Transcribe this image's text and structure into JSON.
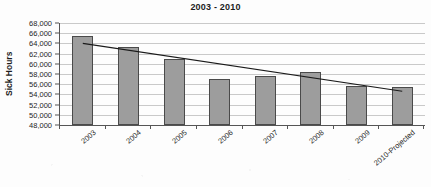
{
  "chart_data": {
    "type": "bar",
    "title": "2003 - 2010",
    "xlabel": "",
    "ylabel": "Sick Hours",
    "categories": [
      "2003",
      "2004",
      "2005",
      "2006",
      "2007",
      "2008",
      "2009",
      "2010-Projected"
    ],
    "values": [
      65500,
      63200,
      61000,
      57000,
      57700,
      58400,
      55700,
      55500
    ],
    "series": [
      {
        "name": "Sick Hours",
        "type": "bar",
        "values": [
          65500,
          63200,
          61000,
          57000,
          57700,
          58400,
          55700,
          55500
        ]
      },
      {
        "name": "Linear Trend",
        "type": "line",
        "values": [
          64000,
          62650,
          61300,
          59950,
          58600,
          57250,
          55900,
          54600
        ]
      }
    ],
    "ylim": [
      48000,
      68000
    ],
    "ytick_labels": [
      "68,000",
      "66,000",
      "64,000",
      "62,000",
      "60,000",
      "58,000",
      "56,000",
      "54,000",
      "52,000",
      "50,000",
      "48,000"
    ],
    "ytick_values": [
      68000,
      66000,
      64000,
      62000,
      60000,
      58000,
      56000,
      54000,
      52000,
      50000,
      48000
    ],
    "ytick_step": 2000,
    "grid": true,
    "legend": false,
    "legend_position": "none",
    "bar_fill_color": "#9d9d9d",
    "bar_border_color": "#4a4a4a",
    "gridline_color": "#c9c9c9",
    "axis_color": "#555555",
    "trendline_color": "#1a1a1a",
    "text_color": "#1d1d1d",
    "background_color": "#fdfdfd",
    "annotations": []
  }
}
